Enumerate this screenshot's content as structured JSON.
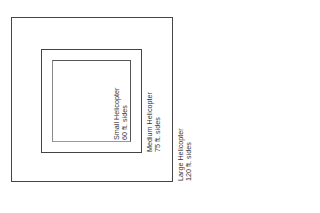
{
  "diagram": {
    "areas": [
      {
        "name": "Small Helicopter",
        "size": "60 ft. sides"
      },
      {
        "name": "Medium Helicopter",
        "size": "75 ft. sides"
      },
      {
        "name": "Large Helicopter",
        "size": "120 ft. sides"
      }
    ],
    "colors": {
      "line": "#444444",
      "text": "#333333",
      "background": "#ffffff"
    }
  }
}
